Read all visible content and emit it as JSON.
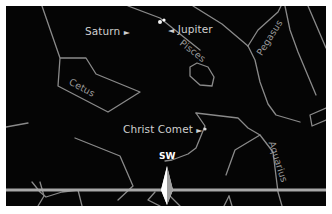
{
  "map": {
    "background_color": "#050505",
    "line_color": "#8a8a8a",
    "horizon_color": "#a8a8a8"
  },
  "objects": {
    "saturn": {
      "label": "Saturn",
      "marker": "►"
    },
    "jupiter": {
      "label": "Jupiter",
      "marker": "◄"
    },
    "comet": {
      "label": "Christ Comet",
      "marker": "►"
    }
  },
  "constellations": {
    "pisces": "Pisces",
    "pegasus": "Pegasus",
    "cetus": "Cetus",
    "aquarius": "Aquarius"
  },
  "compass": {
    "direction": "SW"
  }
}
